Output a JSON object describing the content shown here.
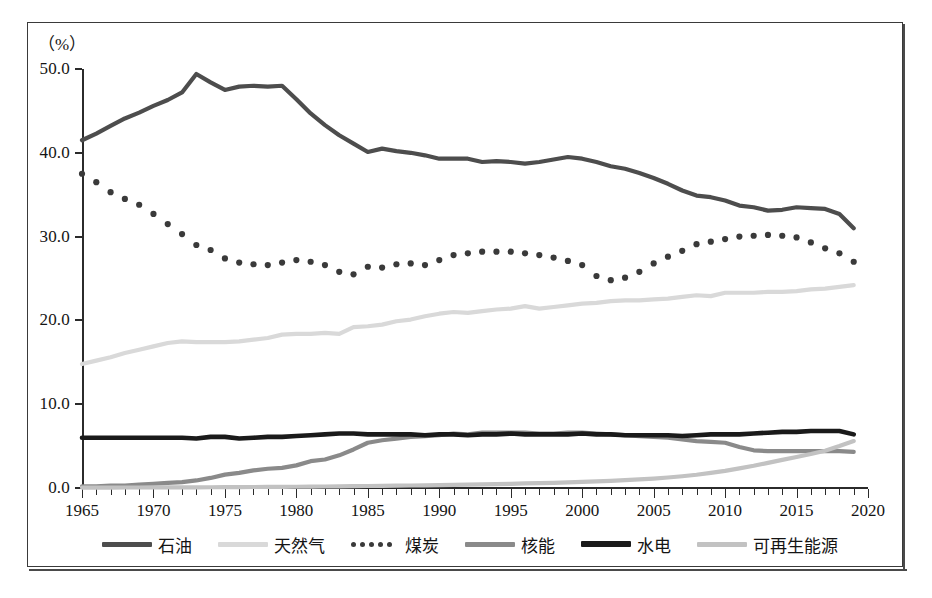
{
  "figure": {
    "unit_label": "（%）",
    "x_axis_unit": "（年）",
    "caption": ""
  },
  "legend": {
    "position": "bottom",
    "items": [
      {
        "label": "石油",
        "key": "oil",
        "color": "#4d4d4d",
        "style": "solid",
        "width": 5
      },
      {
        "label": "天然气",
        "key": "gas",
        "color": "#d9d9d9",
        "style": "solid",
        "width": 5
      },
      {
        "label": "煤炭",
        "key": "coal",
        "color": "#3a3a3a",
        "style": "dotted",
        "width": 5
      },
      {
        "label": "核能",
        "key": "nuclear",
        "color": "#8a8a8a",
        "style": "solid",
        "width": 5
      },
      {
        "label": "水电",
        "key": "hydro",
        "color": "#1a1a1a",
        "style": "solid",
        "width": 5
      },
      {
        "label": "可再生能源",
        "key": "renewables",
        "color": "#c2c2c2",
        "style": "solid",
        "width": 5
      }
    ]
  },
  "chart_data": {
    "type": "line",
    "title": "",
    "xlabel": "（年）",
    "ylabel": "（%）",
    "xlim": [
      1965,
      2020
    ],
    "ylim": [
      0,
      50
    ],
    "ytick_values": [
      0,
      10,
      20,
      30,
      40,
      50
    ],
    "ytick_labels": [
      "0.0",
      "10.0",
      "20.0",
      "30.0",
      "40.0",
      "50.0"
    ],
    "xtick_major": [
      1965,
      1970,
      1975,
      1980,
      1985,
      1990,
      1995,
      2000,
      2005,
      2010,
      2015,
      2020
    ],
    "xtick_labels": [
      "1965",
      "1970",
      "1975",
      "1980",
      "1985",
      "1990",
      "1995",
      "2000",
      "2005",
      "2010",
      "2015",
      "2020"
    ],
    "xtick_minor_step": 1,
    "grid": false,
    "x": [
      1965,
      1966,
      1967,
      1968,
      1969,
      1970,
      1971,
      1972,
      1973,
      1974,
      1975,
      1976,
      1977,
      1978,
      1979,
      1980,
      1981,
      1982,
      1983,
      1984,
      1985,
      1986,
      1987,
      1988,
      1989,
      1990,
      1991,
      1992,
      1993,
      1994,
      1995,
      1996,
      1997,
      1998,
      1999,
      2000,
      2001,
      2002,
      2003,
      2004,
      2005,
      2006,
      2007,
      2008,
      2009,
      2010,
      2011,
      2012,
      2013,
      2014,
      2015,
      2016,
      2017,
      2018,
      2019
    ],
    "series": [
      {
        "name": "石油",
        "key": "oil",
        "color": "#4d4d4d",
        "style": "solid",
        "values": [
          41.5,
          42.3,
          43.2,
          44.1,
          44.8,
          45.6,
          46.3,
          47.2,
          49.4,
          48.4,
          47.5,
          47.9,
          48.0,
          47.9,
          48.0,
          46.4,
          44.7,
          43.3,
          42.1,
          41.1,
          40.1,
          40.5,
          40.2,
          40.0,
          39.7,
          39.3,
          39.3,
          39.3,
          38.9,
          39.0,
          38.9,
          38.7,
          38.9,
          39.2,
          39.5,
          39.3,
          38.9,
          38.4,
          38.1,
          37.6,
          37.0,
          36.3,
          35.5,
          34.9,
          34.7,
          34.3,
          33.7,
          33.5,
          33.1,
          33.2,
          33.5,
          33.4,
          33.3,
          32.7,
          31.0
        ]
      },
      {
        "name": "天然气",
        "key": "gas",
        "color": "#d9d9d9",
        "style": "solid",
        "values": [
          14.8,
          15.2,
          15.6,
          16.1,
          16.5,
          16.9,
          17.3,
          17.5,
          17.4,
          17.4,
          17.4,
          17.5,
          17.7,
          17.9,
          18.3,
          18.4,
          18.4,
          18.5,
          18.4,
          19.2,
          19.3,
          19.5,
          19.9,
          20.1,
          20.5,
          20.8,
          21.0,
          20.9,
          21.1,
          21.3,
          21.4,
          21.7,
          21.4,
          21.6,
          21.8,
          22.0,
          22.1,
          22.3,
          22.4,
          22.4,
          22.5,
          22.6,
          22.8,
          23.0,
          22.9,
          23.3,
          23.3,
          23.3,
          23.4,
          23.4,
          23.5,
          23.7,
          23.8,
          24.0,
          24.2
        ]
      },
      {
        "name": "煤炭",
        "key": "coal",
        "color": "#3a3a3a",
        "style": "dotted",
        "values": [
          37.5,
          36.5,
          35.3,
          34.5,
          33.8,
          32.7,
          31.5,
          30.3,
          29.0,
          28.4,
          27.4,
          26.9,
          26.7,
          26.6,
          26.9,
          27.2,
          27.0,
          26.6,
          25.8,
          25.5,
          26.4,
          26.3,
          26.7,
          26.8,
          26.6,
          27.2,
          27.8,
          28.0,
          28.2,
          28.2,
          28.2,
          28.0,
          27.8,
          27.5,
          27.1,
          26.6,
          25.3,
          24.8,
          25.1,
          25.8,
          26.8,
          27.6,
          28.3,
          29.1,
          29.4,
          29.7,
          30.0,
          30.1,
          30.2,
          30.1,
          29.9,
          29.3,
          28.6,
          28.0,
          27.0
        ]
      },
      {
        "name": "核能",
        "key": "nuclear",
        "color": "#8a8a8a",
        "style": "solid",
        "values": [
          0.2,
          0.2,
          0.3,
          0.3,
          0.4,
          0.5,
          0.6,
          0.7,
          0.9,
          1.2,
          1.6,
          1.8,
          2.1,
          2.3,
          2.4,
          2.7,
          3.2,
          3.4,
          3.9,
          4.6,
          5.4,
          5.7,
          5.9,
          6.1,
          6.2,
          6.3,
          6.5,
          6.4,
          6.6,
          6.6,
          6.6,
          6.6,
          6.5,
          6.5,
          6.6,
          6.6,
          6.5,
          6.4,
          6.3,
          6.2,
          6.1,
          6.0,
          5.8,
          5.6,
          5.5,
          5.4,
          4.9,
          4.5,
          4.4,
          4.4,
          4.4,
          4.4,
          4.4,
          4.4,
          4.3
        ]
      },
      {
        "name": "水电",
        "key": "hydro",
        "color": "#1a1a1a",
        "style": "solid",
        "values": [
          6.0,
          6.0,
          6.0,
          6.0,
          6.0,
          6.0,
          6.0,
          6.0,
          5.9,
          6.1,
          6.1,
          5.9,
          6.0,
          6.1,
          6.1,
          6.2,
          6.3,
          6.4,
          6.5,
          6.5,
          6.4,
          6.4,
          6.4,
          6.4,
          6.3,
          6.4,
          6.4,
          6.3,
          6.4,
          6.4,
          6.5,
          6.4,
          6.4,
          6.4,
          6.4,
          6.5,
          6.4,
          6.4,
          6.3,
          6.3,
          6.3,
          6.3,
          6.2,
          6.3,
          6.4,
          6.4,
          6.4,
          6.5,
          6.6,
          6.7,
          6.7,
          6.8,
          6.8,
          6.8,
          6.4
        ]
      },
      {
        "name": "可再生能源",
        "key": "renewables",
        "color": "#c2c2c2",
        "style": "solid",
        "values": [
          0.05,
          0.05,
          0.05,
          0.06,
          0.06,
          0.07,
          0.07,
          0.08,
          0.08,
          0.09,
          0.1,
          0.11,
          0.12,
          0.13,
          0.14,
          0.15,
          0.17,
          0.18,
          0.2,
          0.22,
          0.24,
          0.26,
          0.28,
          0.3,
          0.32,
          0.35,
          0.38,
          0.41,
          0.44,
          0.47,
          0.5,
          0.54,
          0.58,
          0.62,
          0.67,
          0.72,
          0.78,
          0.85,
          0.93,
          1.02,
          1.12,
          1.25,
          1.4,
          1.58,
          1.8,
          2.05,
          2.35,
          2.65,
          3.0,
          3.35,
          3.7,
          4.05,
          4.45,
          5.0,
          5.6
        ]
      }
    ]
  }
}
